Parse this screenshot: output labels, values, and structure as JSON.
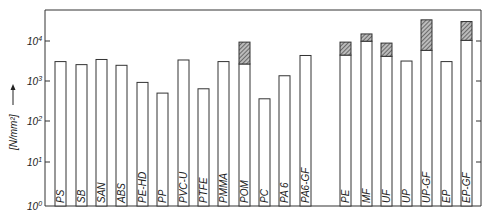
{
  "chart_data": {
    "type": "bar",
    "title": "",
    "xlabel": "",
    "ylabel": "[N/mm²] →",
    "yscale": "log",
    "ylim": [
      1,
      50000
    ],
    "y_ticks": [
      "10⁰",
      "10¹",
      "10²",
      "10³",
      "10⁴"
    ],
    "grid": false,
    "legend": null,
    "categories": [
      "PS",
      "SB",
      "SAN",
      "ABS",
      "PE-HD",
      "PP",
      "PVC-U",
      "PTFE",
      "PMMA",
      "POM",
      "PC",
      "PA 6",
      "PA6-GF",
      "PE",
      "MF",
      "UF",
      "UP",
      "UP-GF",
      "EP",
      "EP-GF"
    ],
    "series": [
      {
        "name": "lower value (white bar)",
        "values": [
          3200,
          2700,
          3600,
          2600,
          1000,
          550,
          3500,
          700,
          3200,
          2800,
          400,
          1450,
          4500,
          4600,
          10000,
          4300,
          3300,
          6000,
          3200,
          10500
        ]
      },
      {
        "name": "upper value (hatched range)",
        "values": [
          null,
          null,
          null,
          null,
          null,
          null,
          null,
          null,
          null,
          9500,
          null,
          null,
          null,
          9500,
          15000,
          9000,
          null,
          33000,
          null,
          30000
        ]
      }
    ]
  },
  "axis": {
    "ylabel": "[N/mm²]",
    "ticks": [
      {
        "label": "10",
        "exp": "0",
        "y": 206
      },
      {
        "label": "10",
        "exp": "1",
        "y": 162
      },
      {
        "label": "10",
        "exp": "2",
        "y": 121
      },
      {
        "label": "10",
        "exp": "3",
        "y": 81
      },
      {
        "label": "10",
        "exp": "4",
        "y": 41
      }
    ]
  }
}
